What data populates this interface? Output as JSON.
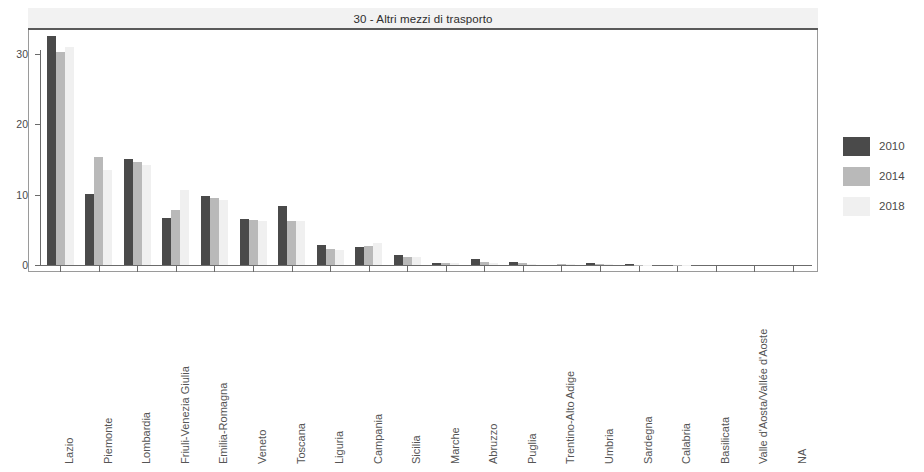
{
  "panel": {
    "strip_title": "30 - Altri mezzi di trasporto"
  },
  "legend": {
    "position": "right",
    "items": [
      {
        "label": "2010",
        "color": "#4a4a4a"
      },
      {
        "label": "2014",
        "color": "#b9b9b9"
      },
      {
        "label": "2018",
        "color": "#f0f0f0"
      }
    ]
  },
  "axes": {
    "y_ticks": [
      "0",
      "10",
      "20",
      "30"
    ],
    "y_tick_values": [
      0,
      10,
      20,
      30
    ],
    "ylim": [
      0,
      33.5
    ],
    "xlabel": "",
    "ylabel": ""
  },
  "chart_data": {
    "type": "bar",
    "title": "30 - Altri mezzi di trasporto",
    "xlabel": "",
    "ylabel": "",
    "ylim": [
      0,
      33.5
    ],
    "grid": false,
    "legend_position": "right",
    "categories": [
      "Lazio",
      "Piemonte",
      "Lombardia",
      "Friuli-Venezia Giulia",
      "Emilia-Romagna",
      "Veneto",
      "Toscana",
      "Liguria",
      "Campania",
      "Sicilia",
      "Marche",
      "Abruzzo",
      "Puglia",
      "Trentino-Alto Adige",
      "Umbria",
      "Sardegna",
      "Calabria",
      "Basilicata",
      "Valle d'Aosta/Vallée d'Aoste",
      "NA"
    ],
    "series": [
      {
        "name": "2010",
        "color": "#4a4a4a",
        "values": [
          32.6,
          10.1,
          15.1,
          6.7,
          9.8,
          6.5,
          8.4,
          2.8,
          2.6,
          1.4,
          0.3,
          0.9,
          0.4,
          0.0,
          0.25,
          0.15,
          0.0,
          0.0,
          0.0,
          0.0
        ]
      },
      {
        "name": "2014",
        "color": "#b9b9b9",
        "values": [
          30.3,
          15.3,
          14.6,
          7.8,
          9.5,
          6.4,
          6.3,
          2.3,
          2.7,
          1.1,
          0.35,
          0.4,
          0.25,
          0.1,
          0.1,
          0.05,
          0.05,
          0.0,
          0.0,
          0.0
        ]
      },
      {
        "name": "2018",
        "color": "#f0f0f0",
        "values": [
          31.0,
          13.5,
          14.2,
          10.6,
          9.3,
          6.2,
          6.3,
          2.2,
          3.1,
          1.1,
          0.3,
          0.3,
          0.2,
          0.1,
          0.1,
          0.05,
          0.05,
          0.0,
          0.0,
          0.0
        ]
      }
    ]
  }
}
